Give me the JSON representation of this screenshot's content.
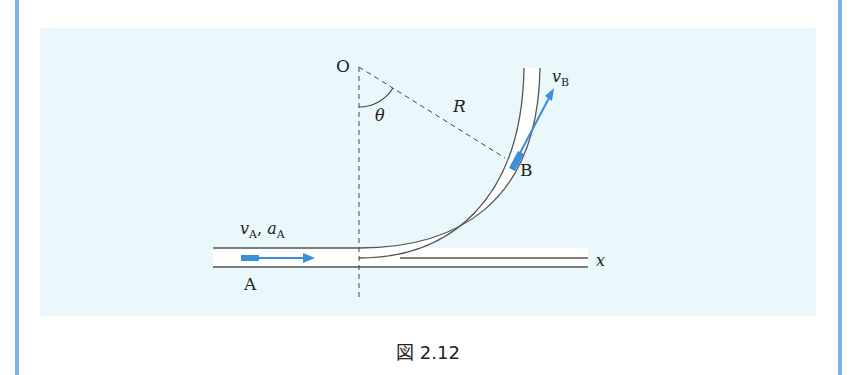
{
  "figure": {
    "caption": "図 2.12",
    "labels": {
      "origin": "O",
      "angle": "θ",
      "radius": "R",
      "point_a": "A",
      "point_b": "B",
      "v_a_main": "v",
      "v_a_sub": "A",
      "a_a_main": "a",
      "a_a_sub": "A",
      "sep": ", ",
      "v_b_main": "v",
      "v_b_sub": "B",
      "axis_x": "x"
    },
    "colors": {
      "border": "#7fb0e6",
      "panel": "#eaf8fb",
      "arrow": "#3a8fd6",
      "line": "#555555"
    }
  }
}
